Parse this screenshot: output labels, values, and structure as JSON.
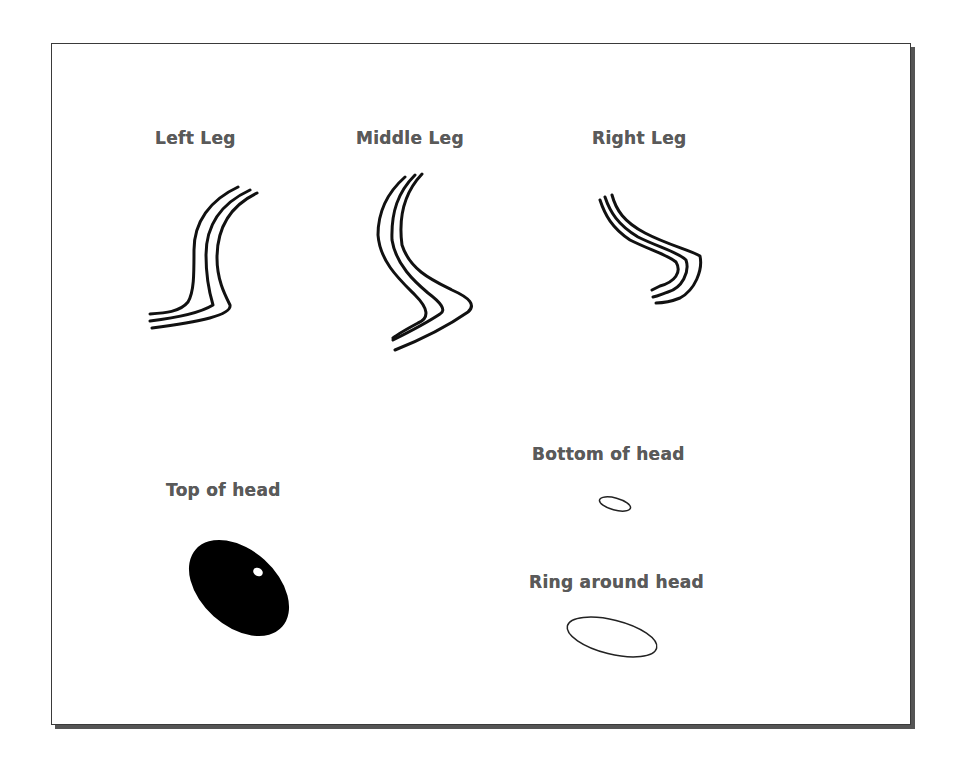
{
  "diagram": {
    "labels": {
      "left_leg": "Left Leg",
      "middle_leg": "Middle Leg",
      "right_leg": "Right Leg",
      "top_of_head": "Top of head",
      "bottom_of_head": "Bottom of head",
      "ring_around_head": "Ring around head"
    },
    "colors": {
      "stroke": "#111111",
      "label": "#5a5a5a",
      "frame_border": "#3a3a3a",
      "shadow": "#555555",
      "fill_head": "#000000",
      "highlight": "#ffffff"
    },
    "parts": [
      {
        "id": "left-leg",
        "type": "three-parallel-curves"
      },
      {
        "id": "middle-leg",
        "type": "three-parallel-curves"
      },
      {
        "id": "right-leg",
        "type": "three-parallel-curves"
      },
      {
        "id": "top-of-head",
        "type": "filled-ellipse-with-highlight"
      },
      {
        "id": "bottom-of-head",
        "type": "small-outlined-ellipse"
      },
      {
        "id": "ring-around-head",
        "type": "outlined-ellipse"
      }
    ]
  }
}
